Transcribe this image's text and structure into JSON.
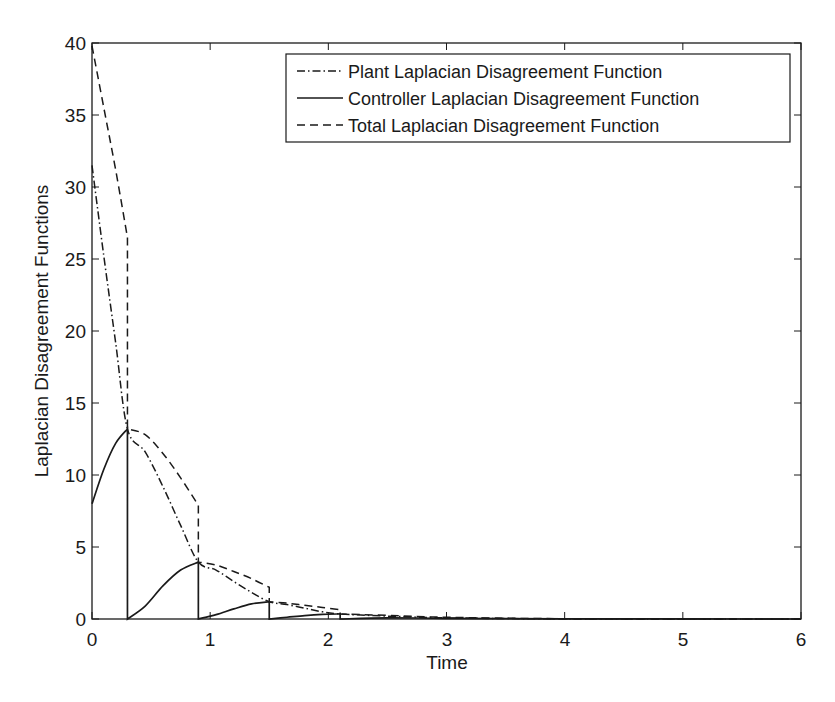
{
  "chart_data": {
    "type": "line",
    "title": "",
    "xlabel": "Time",
    "ylabel": "Laplacian Disagreement Functions",
    "xlim": [
      0,
      6
    ],
    "ylim": [
      0,
      40
    ],
    "xticks": [
      0,
      1,
      2,
      3,
      4,
      5,
      6
    ],
    "yticks": [
      0,
      5,
      10,
      15,
      20,
      25,
      30,
      35,
      40
    ],
    "grid": false,
    "legend_position": "upper right",
    "event_times": [
      0.3,
      0.9,
      1.5,
      2.1
    ],
    "series": [
      {
        "name": "Plant Laplacian Disagreement Function",
        "style": "dash-dot",
        "x": [
          0,
          0.1,
          0.2,
          0.3,
          0.45,
          0.6,
          0.75,
          0.9,
          1.05,
          1.2,
          1.35,
          1.5,
          1.65,
          1.8,
          1.95,
          2.1,
          2.5,
          3,
          4,
          6
        ],
        "values": [
          31.5,
          25.2,
          19.2,
          13.2,
          11.6,
          9.2,
          6.5,
          3.95,
          3.4,
          2.6,
          1.85,
          1.2,
          1.0,
          0.75,
          0.5,
          0.35,
          0.2,
          0.08,
          0.01,
          0
        ]
      },
      {
        "name": "Controller Laplacian Disagreement Function",
        "style": "solid",
        "x": [
          0,
          0.1,
          0.2,
          0.3,
          0.3,
          0.45,
          0.6,
          0.75,
          0.9,
          0.9,
          1.05,
          1.2,
          1.35,
          1.5,
          1.5,
          1.65,
          1.8,
          1.95,
          2.1,
          2.1,
          2.5,
          3,
          4,
          6
        ],
        "values": [
          8.0,
          10.4,
          12.2,
          13.2,
          0,
          0.9,
          2.3,
          3.4,
          3.95,
          0,
          0.3,
          0.7,
          1.05,
          1.2,
          0,
          0.12,
          0.24,
          0.32,
          0.35,
          0,
          0.08,
          0.05,
          0.01,
          0
        ]
      },
      {
        "name": "Total Laplacian Disagreement Function",
        "style": "dashed",
        "x": [
          0,
          0.1,
          0.2,
          0.3,
          0.3,
          0.45,
          0.6,
          0.75,
          0.9,
          0.9,
          1.05,
          1.2,
          1.35,
          1.5,
          1.5,
          1.65,
          1.8,
          1.95,
          2.1,
          2.1,
          2.5,
          3,
          4,
          6
        ],
        "values": [
          39.8,
          35.5,
          31.2,
          26.5,
          13.2,
          12.8,
          11.5,
          9.8,
          7.9,
          3.95,
          3.75,
          3.3,
          2.8,
          2.2,
          1.2,
          1.1,
          0.95,
          0.8,
          0.65,
          0.35,
          0.25,
          0.12,
          0.02,
          0
        ]
      }
    ],
    "legend": [
      "Plant Laplacian Disagreement Function",
      "Controller Laplacian Disagreement Function",
      "Total Laplacian Disagreement Function"
    ]
  },
  "labels": {
    "xlabel": "Time",
    "ylabel": "Laplacian Disagreement Functions",
    "xticks": [
      "0",
      "1",
      "2",
      "3",
      "4",
      "5",
      "6"
    ],
    "yticks": [
      "0",
      "5",
      "10",
      "15",
      "20",
      "25",
      "30",
      "35",
      "40"
    ],
    "legend": {
      "plant": "Plant Laplacian Disagreement Function",
      "controller": "Controller Laplacian Disagreement Function",
      "total": "Total Laplacian Disagreement Function"
    }
  },
  "colors": {
    "line": "#1a1a1a",
    "axes": "#1a1a1a",
    "background": "#ffffff"
  }
}
